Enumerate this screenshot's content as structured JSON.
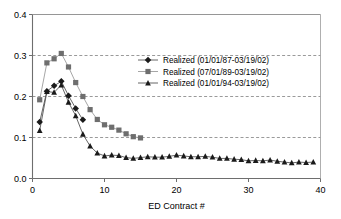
{
  "chart_data": {
    "type": "line",
    "title": "",
    "xlabel": "ED Contract #",
    "ylabel": "",
    "xlim": [
      0,
      40
    ],
    "ylim": [
      0.0,
      0.4
    ],
    "xticks": [
      "0",
      "10",
      "20",
      "30",
      "40"
    ],
    "xtick_values": [
      0,
      10,
      20,
      30,
      40
    ],
    "yticks": [
      "0.0",
      "0.1",
      "0.2",
      "0.3",
      "0.4"
    ],
    "ytick_values": [
      0.0,
      0.1,
      0.2,
      0.3,
      0.4
    ],
    "grid": "horizontal-dashed",
    "legend_position": "upper-right-inside",
    "series": [
      {
        "name": "Realized (01/01/87-03/19/02)",
        "marker": "diamond",
        "color": "#1a1a1a",
        "x": [
          1,
          2,
          3,
          4,
          5,
          6,
          7
        ],
        "values": [
          0.138,
          0.213,
          0.226,
          0.237,
          0.202,
          0.171,
          0.143
        ]
      },
      {
        "name": "Realized (07/01/89-03/19/02)",
        "marker": "square",
        "color": "#6e6e6e",
        "x": [
          1,
          2,
          3,
          4,
          5,
          6,
          7,
          8,
          9,
          10,
          11,
          12,
          13,
          14,
          15
        ],
        "values": [
          0.192,
          0.282,
          0.292,
          0.305,
          0.272,
          0.234,
          0.2,
          0.168,
          0.144,
          0.131,
          0.125,
          0.118,
          0.109,
          0.102,
          0.099
        ]
      },
      {
        "name": "Realized (01/01/94-03/19/02)",
        "marker": "triangle",
        "color": "#1a1a1a",
        "x": [
          1,
          2,
          3,
          4,
          5,
          6,
          7,
          8,
          9,
          10,
          11,
          12,
          13,
          14,
          15,
          16,
          17,
          18,
          19,
          20,
          21,
          22,
          23,
          24,
          25,
          26,
          27,
          28,
          29,
          30,
          31,
          32,
          33,
          34,
          35,
          36,
          37,
          38,
          39
        ],
        "values": [
          0.117,
          0.212,
          0.21,
          0.228,
          0.186,
          0.153,
          0.108,
          0.079,
          0.062,
          0.055,
          0.057,
          0.056,
          0.051,
          0.049,
          0.051,
          0.053,
          0.052,
          0.052,
          0.054,
          0.057,
          0.055,
          0.053,
          0.053,
          0.054,
          0.052,
          0.049,
          0.049,
          0.047,
          0.046,
          0.043,
          0.044,
          0.043,
          0.045,
          0.042,
          0.04,
          0.038,
          0.04,
          0.039,
          0.04
        ]
      }
    ]
  },
  "legend": {
    "entries": [
      "Realized (01/01/87-03/19/02)",
      "Realized (07/01/89-03/19/02)",
      "Realized (01/01/94-03/19/02)"
    ]
  }
}
